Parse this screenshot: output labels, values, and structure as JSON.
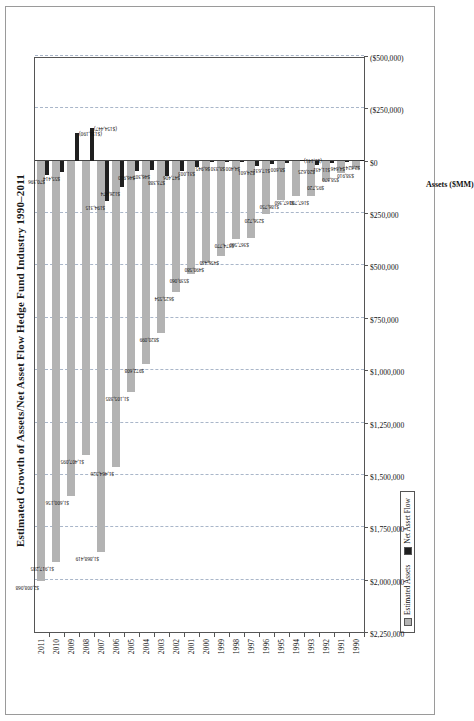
{
  "chart_data": {
    "type": "bar",
    "title": "Estimated Growth of Assets/Net Asset Flow Hedge Fund Industry 1990–2011",
    "orientation": "horizontal-bar-rotated-90",
    "xlabel": "",
    "ylabel": "Assets ($MM)",
    "grid": true,
    "legend_position": "bottom-left",
    "axis_title": "Assets ($MM)",
    "value_axis": {
      "min": -500000,
      "max": 2250000,
      "step": 250000,
      "ticks": [
        "$2,250,000",
        "$2,000,000",
        "$1,750,000",
        "$1,500,000",
        "$1,250,000",
        "$1,000,000",
        "$750,000",
        "$500,000",
        "$250,000",
        "$0",
        "($250,000)",
        "($500,000)"
      ],
      "tick_values": [
        2250000,
        2000000,
        1750000,
        1500000,
        1250000,
        1000000,
        750000,
        500000,
        250000,
        0,
        -250000,
        -500000
      ]
    },
    "categories": [
      "1990",
      "1991",
      "1992",
      "1993",
      "1994",
      "1995",
      "1996",
      "1997",
      "1998",
      "1999",
      "2000",
      "2001",
      "2002",
      "2003",
      "2004",
      "2005",
      "2006",
      "2007",
      "2008",
      "2009",
      "2010",
      "2011"
    ],
    "series": [
      {
        "name": "Estimated Assets",
        "color": "#b3b3b3",
        "values": [
          38910,
          58370,
          95720,
          167780,
          167360,
          186750,
          256720,
          367560,
          374770,
          456430,
          490580,
          539060,
          625554,
          820099,
          972608,
          1105385,
          1464526,
          1868419,
          1407095,
          1600156,
          1917285,
          2008068
        ],
        "labels": [
          "$38,910",
          "$58,370",
          "$95,720",
          "$167,790",
          "$167,360",
          "$186,750",
          "$256,720",
          "$367,560",
          "$374,770",
          "$456,430",
          "$490,580",
          "$539,060",
          "$625,554",
          "$820,099",
          "$972,608",
          "$1,105,385",
          "$1,464,526",
          "$1,868,419",
          "$1,407,095",
          "$1,600,156",
          "$1,917,285",
          "$2,008,068"
        ]
      },
      {
        "name": "Net Asset Flow",
        "color": "#1f1f1f",
        "values": [
          2624,
          4646,
          11431,
          20625,
          -1141,
          8600,
          17631,
          24601,
          4400,
          8330,
          6945,
          31003,
          47406,
          73388,
          46307,
          46910,
          126474,
          194315,
          -154447,
          -131190,
          55414,
          70396
        ],
        "labels": [
          "$2,624",
          "$4,646",
          "$11,431",
          "$20,625",
          "($1,141)",
          "$8,600",
          "$17,631",
          "$24,601",
          "$4,400",
          "$8,330",
          "$6,945",
          "$31,003",
          "$47,406",
          "$73,388",
          "$46,307",
          "$46,910",
          "$126,474",
          "$194,315",
          "($154,447)",
          "($131,190)",
          "$55,414",
          "$70,396"
        ]
      }
    ]
  },
  "legend": {
    "items": [
      {
        "label": "Estimated Assets"
      },
      {
        "label": "Net Asset Flow"
      }
    ]
  }
}
